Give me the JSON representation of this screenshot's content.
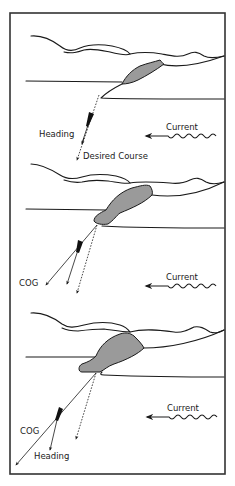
{
  "figure": {
    "frame_color": "#333333",
    "land_fill": "#9a9a9a"
  },
  "panels": [
    {
      "id": "panel-1",
      "labels": {
        "heading": "Heading",
        "desired_course": "Desired Course",
        "current": "Current"
      }
    },
    {
      "id": "panel-2",
      "labels": {
        "cog": "COG",
        "current": "Current"
      }
    },
    {
      "id": "panel-3",
      "labels": {
        "cog": "COG",
        "heading": "Heading",
        "current": "Current"
      }
    }
  ]
}
